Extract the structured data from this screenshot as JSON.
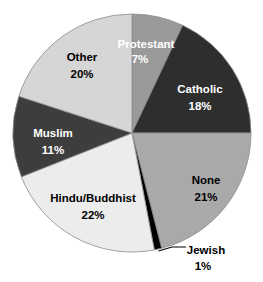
{
  "chart_data": {
    "type": "pie",
    "title": "",
    "subtitle": "",
    "xlabel": "",
    "ylabel": "",
    "legend_position": "none",
    "grid": false,
    "labels_inside": true,
    "unit": "%",
    "total": 100,
    "categories": [
      "Protestant",
      "Catholic",
      "None",
      "Jewish",
      "Hindu/Buddhist",
      "Muslim",
      "Other"
    ],
    "values": [
      7,
      18,
      21,
      1,
      22,
      11,
      20
    ],
    "slices": [
      {
        "name": "Protestant",
        "label": "Protestant",
        "value": 7,
        "value_text": "7%",
        "color": "#9a9a9a",
        "text_color": "#ffffff",
        "label_x": 146,
        "label_y": 45,
        "value_x": 140,
        "value_y": 60,
        "external": false
      },
      {
        "name": "Catholic",
        "label": "Catholic",
        "value": 18,
        "value_text": "18%",
        "color": "#2e2e2e",
        "text_color": "#ffffff",
        "label_x": 200,
        "label_y": 90,
        "value_x": 200,
        "value_y": 107,
        "external": false
      },
      {
        "name": "None",
        "label": "None",
        "value": 21,
        "value_text": "21%",
        "color": "#a9a9a9",
        "text_color": "#000000",
        "label_x": 206,
        "label_y": 181,
        "value_x": 206,
        "value_y": 198,
        "external": false
      },
      {
        "name": "Jewish",
        "label": "Jewish",
        "value": 1,
        "value_text": "1%",
        "color": "#000000",
        "text_color": "#000000",
        "label_x": 206,
        "label_y": 251,
        "value_x": 203,
        "value_y": 267,
        "external": true
      },
      {
        "name": "Hindu/Buddhist",
        "label": "Hindu/Buddhist",
        "value": 22,
        "value_text": "22%",
        "color": "#ececec",
        "text_color": "#000000",
        "label_x": 93,
        "label_y": 199,
        "value_x": 93,
        "value_y": 216,
        "external": false
      },
      {
        "name": "Muslim",
        "label": "Muslim",
        "value": 11,
        "value_text": "11%",
        "color": "#3d3d3d",
        "text_color": "#ffffff",
        "label_x": 53,
        "label_y": 134,
        "value_x": 53,
        "value_y": 151,
        "external": false
      },
      {
        "name": "Other",
        "label": "Other",
        "value": 20,
        "value_text": "20%",
        "color": "#d6d6d6",
        "text_color": "#000000",
        "label_x": 82,
        "label_y": 58,
        "value_x": 82,
        "value_y": 75,
        "external": false
      }
    ],
    "geometry": {
      "center_x": 132,
      "center_y": 133,
      "radius": 119,
      "start_angle_deg": 0,
      "direction": "clockwise"
    },
    "colors": {
      "background": "#ffffff",
      "outline": "#8c8c8c",
      "leader_line": "#000000"
    }
  }
}
